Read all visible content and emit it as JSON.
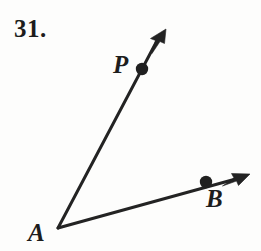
{
  "figure": {
    "exercise_number": "31.",
    "type": "angle-diagram",
    "stroke_color": "#232323",
    "background_color": "#fdfdfc",
    "stroke_width": 3,
    "dot_radius": 6,
    "labels": {
      "vertex": "A",
      "ray1_point": "P",
      "ray2_point": "B"
    },
    "points": {
      "A": {
        "x": 58,
        "y": 228
      },
      "P": {
        "x": 142,
        "y": 69
      },
      "B": {
        "x": 206,
        "y": 182
      }
    },
    "rays": [
      {
        "name": "ray-AP",
        "from": "A",
        "through": "P",
        "arrow_tip": {
          "x": 166,
          "y": 29
        },
        "has_arrowhead": true
      },
      {
        "name": "ray-AB",
        "from": "A",
        "through": "B",
        "arrow_tip": {
          "x": 250,
          "y": 174
        },
        "has_arrowhead": true
      }
    ]
  }
}
